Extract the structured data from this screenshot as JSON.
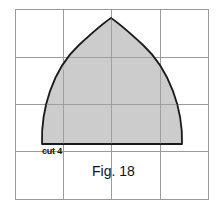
{
  "figure": {
    "caption": "Fig. 18",
    "cut_label": "cut 4",
    "shape": "pointed-arch (Reuleaux-like) pattern piece on a square grid",
    "grid": {
      "columns": 4,
      "rows": 4
    },
    "colors": {
      "fill": "#c3c3c3",
      "outline": "#1a1a1a",
      "grid": "#9a9a9a",
      "background": "#ffffff"
    }
  }
}
